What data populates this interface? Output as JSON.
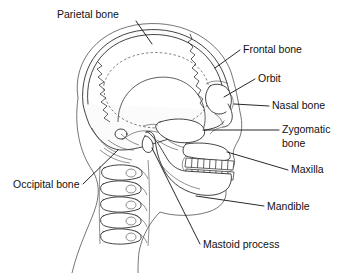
{
  "figure": {
    "style": "black and white line drawing",
    "background_color": "#ffffff",
    "line_color": "#111111",
    "label_font_size_px": 10.5
  },
  "labels": [
    {
      "id": "parietal-bone",
      "text": "Parietal bone",
      "x": 57,
      "y": 18,
      "anchor": "start",
      "leader": "M 136 21 L 152 44",
      "points_to": "upper cranial vault"
    },
    {
      "id": "frontal-bone",
      "text": "Frontal bone",
      "x": 243,
      "y": 53,
      "anchor": "start",
      "leader": "M 240 50 L 215 68",
      "points_to": "forehead region"
    },
    {
      "id": "orbit",
      "text": "Orbit",
      "x": 258,
      "y": 82,
      "anchor": "start",
      "leader": "M 255 79 L 224 97",
      "points_to": "eye socket"
    },
    {
      "id": "nasal-bone",
      "text": "Nasal bone",
      "x": 272,
      "y": 109,
      "anchor": "start",
      "leader": "M 269 106 L 234 104",
      "points_to": "bridge of nose"
    },
    {
      "id": "zygomatic-bone",
      "text": "Zygomatic",
      "text2": "bone",
      "x": 282,
      "y": 133,
      "y2": 147,
      "anchor": "start",
      "leader": "M 279 130 L 203 130",
      "points_to": "cheek bone"
    },
    {
      "id": "maxilla",
      "text": "Maxilla",
      "x": 291,
      "y": 173,
      "anchor": "start",
      "leader": "M 288 170 L 227 152",
      "points_to": "upper jaw"
    },
    {
      "id": "mandible",
      "text": "Mandible",
      "x": 267,
      "y": 210,
      "anchor": "start",
      "leader": "M 264 206 L 196 196",
      "points_to": "lower jaw"
    },
    {
      "id": "mastoid-process",
      "text": "Mastoid process",
      "x": 203,
      "y": 248,
      "anchor": "start",
      "leader": "M 200 244 L 152 148",
      "points_to": "bony projection behind ear"
    },
    {
      "id": "occipital-bone",
      "text": "Occipital bone",
      "x": 13,
      "y": 188,
      "anchor": "start",
      "leader": "M 83 184 L 118 150",
      "points_to": "back of skull"
    }
  ],
  "anatomy": {
    "structures": [
      "cranial vault",
      "frontal bone",
      "parietal bone",
      "occipital bone",
      "temporal bone",
      "orbit",
      "nasal bone",
      "zygomatic arch",
      "maxilla",
      "mandible",
      "mastoid process",
      "upper teeth row",
      "lower teeth row",
      "cervical vertebrae",
      "soft tissue profile"
    ],
    "teeth": {
      "upper_count": 8,
      "lower_count": 8
    },
    "vertebrae_count": 6
  }
}
